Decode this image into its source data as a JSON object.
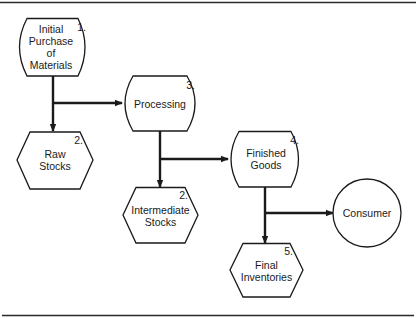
{
  "diagram": {
    "type": "flowchart",
    "colors": {
      "stroke": "#1a1a1a",
      "fill": "#ffffff",
      "background": "#ffffff"
    },
    "nodes": [
      {
        "id": "initial-purchase",
        "shape": "terminal",
        "number": "1.",
        "lines": [
          "Initial",
          "Purchase",
          "of",
          "Materials"
        ]
      },
      {
        "id": "raw-stocks",
        "shape": "hexagon",
        "number": "2.",
        "lines": [
          "Raw",
          "Stocks"
        ]
      },
      {
        "id": "processing",
        "shape": "terminal",
        "number": "3.",
        "lines": [
          "Processing"
        ]
      },
      {
        "id": "intermediate-stocks",
        "shape": "hexagon",
        "number": "2.",
        "lines": [
          "Intermediate",
          "Stocks"
        ]
      },
      {
        "id": "finished-goods",
        "shape": "terminal",
        "number": "4.",
        "lines": [
          "Finished",
          "Goods"
        ]
      },
      {
        "id": "final-inventories",
        "shape": "hexagon",
        "number": "5.",
        "lines": [
          "Final",
          "Inventories"
        ]
      },
      {
        "id": "consumer",
        "shape": "circle",
        "number": "",
        "lines": [
          "Consumer"
        ]
      }
    ],
    "edges": [
      {
        "from": "initial-purchase",
        "to": "raw-stocks"
      },
      {
        "from": "initial-purchase",
        "to": "processing"
      },
      {
        "from": "processing",
        "to": "intermediate-stocks"
      },
      {
        "from": "processing",
        "to": "finished-goods"
      },
      {
        "from": "finished-goods",
        "to": "final-inventories"
      },
      {
        "from": "finished-goods",
        "to": "consumer"
      }
    ]
  }
}
